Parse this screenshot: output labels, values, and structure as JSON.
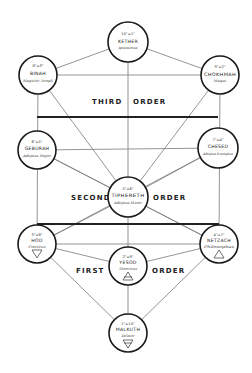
{
  "diagram": {
    "orders": [
      {
        "label_left": "THIRD",
        "label_right": "ORDER"
      },
      {
        "label_left": "SECOND",
        "label_right": "ORDER"
      },
      {
        "label_left": "FIRST",
        "label_right": "ORDER"
      }
    ],
    "nodes": [
      {
        "id": "kether",
        "grade": "10°=1°",
        "name": "KETHER",
        "title": "Ipsissimus",
        "symbol": ""
      },
      {
        "id": "binah",
        "grade": "8°=3°",
        "name": "BINAH",
        "title": "Magister Templi",
        "symbol": ""
      },
      {
        "id": "chokhmah",
        "grade": "9°=2°",
        "name": "CHOKHMAH",
        "title": "Magus",
        "symbol": ""
      },
      {
        "id": "geburah",
        "grade": "6°=5°",
        "name": "GEBURAH",
        "title": "Adeptus Major",
        "symbol": ""
      },
      {
        "id": "chesed",
        "grade": "7°=4°",
        "name": "CHESED",
        "title": "Adeptus Exemptus",
        "symbol": ""
      },
      {
        "id": "tiphereth",
        "grade": "5°=6°",
        "name": "TIPHERETH",
        "title": "Adeptus Minor",
        "symbol": ""
      },
      {
        "id": "hod",
        "grade": "3°=8°",
        "name": "HOD",
        "title": "Practicus",
        "symbol": "water-triangle"
      },
      {
        "id": "netzach",
        "grade": "4°=7°",
        "name": "NETZACH",
        "title": "Philosophus",
        "symbol": "fire-triangle"
      },
      {
        "id": "yesod",
        "grade": "2°=9°",
        "name": "YESOD",
        "title": "Theoricus",
        "symbol": "air-triangle"
      },
      {
        "id": "malkuth",
        "grade": "1°=10°",
        "name": "MALKUTH",
        "title": "Zelator",
        "symbol": "earth-triangle"
      }
    ]
  }
}
